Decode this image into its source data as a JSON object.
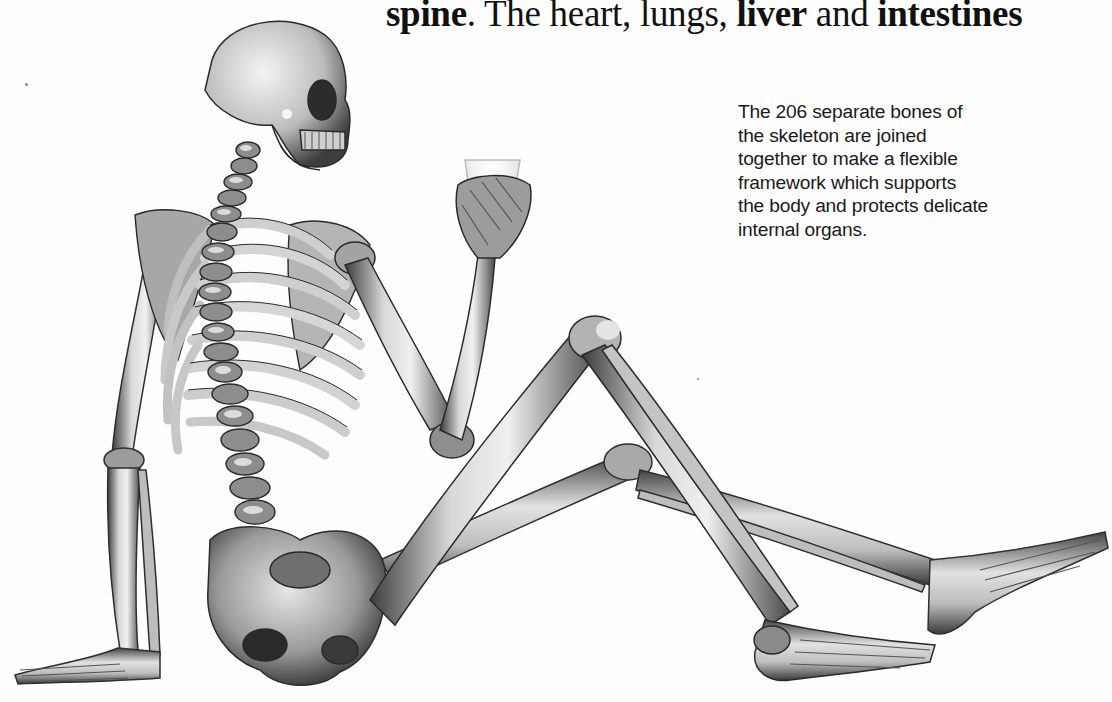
{
  "headline": {
    "parts": [
      {
        "text": "spine",
        "bold": true
      },
      {
        "text": ". The heart, lungs, ",
        "bold": false
      },
      {
        "text": "liver",
        "bold": true
      },
      {
        "text": " and ",
        "bold": false
      },
      {
        "text": "intestines",
        "bold": true
      }
    ]
  },
  "caption": {
    "lines": [
      "The 206 separate bones of",
      "the skeleton are joined",
      "together to make a flexible",
      "framework which supports",
      "the body and protects delicate",
      "internal organs."
    ]
  },
  "illustration": {
    "subject": "seated human skeleton holding a glass",
    "bone_count": "206"
  },
  "colors": {
    "background": "#fefefe",
    "text": "#111111",
    "bone_light": "#e8e8e8",
    "bone_mid": "#9a9a9a",
    "bone_dark": "#3a3a3a"
  }
}
